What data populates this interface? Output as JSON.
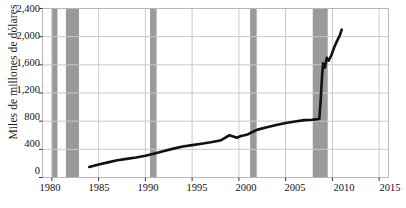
{
  "chart_data": {
    "type": "line",
    "title": "",
    "subtitle": "",
    "xlabel": "",
    "ylabel": "Miles de millones de dólares",
    "xlim": [
      1979,
      2016
    ],
    "ylim": [
      0,
      2400
    ],
    "grid": true,
    "legend": null,
    "y_ticks": [
      "0",
      "400",
      "800",
      "1,200",
      "1,600",
      "2,000",
      "2,400"
    ],
    "y_tick_values": [
      0,
      400,
      800,
      1200,
      1600,
      2000,
      2400
    ],
    "x_ticks": [
      "1980",
      "1985",
      "1990",
      "1995",
      "2000",
      "2005",
      "2010",
      "2015"
    ],
    "x_tick_values": [
      1980,
      1985,
      1990,
      1995,
      2000,
      2005,
      2010,
      2015
    ],
    "line_color": "#111111",
    "recession_band_color": "#9a9a9a",
    "recession_bands": [
      {
        "start": 1980.0,
        "end": 1980.6
      },
      {
        "start": 1981.5,
        "end": 1982.9
      },
      {
        "start": 1990.5,
        "end": 1991.2
      },
      {
        "start": 2001.2,
        "end": 2001.9
      },
      {
        "start": 2007.9,
        "end": 2009.5
      }
    ],
    "series": [
      {
        "name": "Base monetaria",
        "x": [
          1984.0,
          1985.0,
          1986.0,
          1987.0,
          1988.0,
          1989.0,
          1990.0,
          1991.0,
          1992.0,
          1993.0,
          1994.0,
          1995.0,
          1996.0,
          1997.0,
          1998.0,
          1999.0,
          1999.8,
          2000.2,
          2000.6,
          2001.0,
          2001.5,
          2002.0,
          2003.0,
          2004.0,
          2005.0,
          2006.0,
          2007.0,
          2007.8,
          2008.2,
          2008.6,
          2008.75,
          2008.9,
          2009.0,
          2009.2,
          2009.4,
          2009.6,
          2009.9,
          2010.2,
          2010.5,
          2010.8,
          2011.0
        ],
        "y": [
          150,
          185,
          215,
          245,
          265,
          285,
          310,
          340,
          375,
          410,
          440,
          460,
          480,
          500,
          525,
          600,
          565,
          590,
          600,
          615,
          650,
          680,
          715,
          745,
          775,
          795,
          815,
          820,
          825,
          830,
          1100,
          1450,
          1620,
          1560,
          1700,
          1660,
          1740,
          1850,
          1940,
          2020,
          2100
        ]
      }
    ]
  }
}
